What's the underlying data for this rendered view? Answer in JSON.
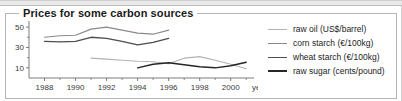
{
  "window": {
    "title": "Prices for some carbon sources"
  },
  "chart_data": {
    "type": "line",
    "title": "Prices for some carbon sources",
    "xlabel": "year",
    "ylabel": "",
    "xlim": [
      1987,
      2001.5
    ],
    "ylim": [
      0,
      55
    ],
    "x_ticks": [
      1988,
      1990,
      1992,
      1994,
      1996,
      1998,
      2000
    ],
    "x_tick_labels": [
      "1988",
      "1990",
      "1992",
      "1994",
      "1996",
      "1998",
      "2000"
    ],
    "x_minor_ticks": [
      1989,
      1991,
      1993,
      1995,
      1997,
      1999,
      2001
    ],
    "y_ticks": [
      10,
      30,
      50
    ],
    "y_tick_labels": [
      "10",
      "30",
      "50"
    ],
    "y_minor_ticks": [
      20,
      40
    ],
    "grid": false,
    "legend_position": "right",
    "series": [
      {
        "name": "raw oil (US$/barrel)",
        "color": "#b3b3b3",
        "width": 1.1,
        "x": [
          1991,
          1992,
          1993,
          1994,
          1995,
          1996,
          1997,
          1998,
          1999,
          2000,
          2001
        ],
        "values": [
          19.5,
          18.5,
          17.5,
          16.5,
          16.0,
          14.0,
          19.5,
          21.0,
          17.5,
          13.5,
          9.0
        ]
      },
      {
        "name": "corn starch (€/100kg)",
        "color": "#8a8a8a",
        "width": 1.2,
        "x": [
          1988,
          1989,
          1990,
          1991,
          1992,
          1993,
          1994,
          1995,
          1996
        ],
        "values": [
          40.0,
          41.5,
          42.0,
          48.0,
          50.0,
          47.0,
          44.0,
          43.0,
          47.0
        ]
      },
      {
        "name": "wheat starch (€/100kg)",
        "color": "#4d4d4d",
        "width": 1.3,
        "x": [
          1988,
          1989,
          1990,
          1991,
          1992,
          1993,
          1994,
          1995,
          1996
        ],
        "values": [
          36.0,
          35.5,
          36.0,
          40.0,
          39.0,
          36.0,
          32.5,
          35.0,
          39.0
        ]
      },
      {
        "name": "raw sugar (cents/pound)",
        "color": "#262626",
        "width": 1.4,
        "x": [
          1994,
          1995,
          1996,
          1997,
          1998,
          1999,
          2000,
          2001
        ],
        "values": [
          10.0,
          13.5,
          15.0,
          13.0,
          11.0,
          10.0,
          12.0,
          15.5
        ]
      }
    ]
  },
  "legend": {
    "items": [
      {
        "label": "raw oil (US$/barrel)",
        "color": "#b3b3b3",
        "width": "1.1px"
      },
      {
        "label": "corn starch (€/100kg)",
        "color": "#8a8a8a",
        "width": "1.4px"
      },
      {
        "label": "wheat starch (€/100kg)",
        "color": "#4d4d4d",
        "width": "1.7px"
      },
      {
        "label": "raw sugar (cents/pound)",
        "color": "#262626",
        "width": "2px"
      }
    ]
  }
}
